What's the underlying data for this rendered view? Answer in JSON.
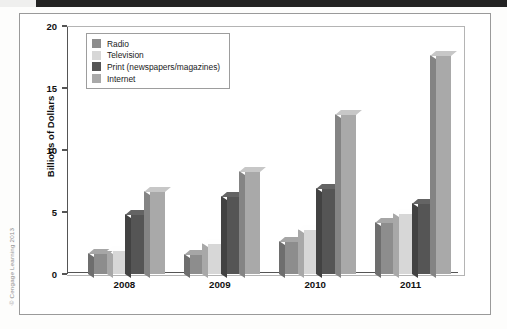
{
  "credit": "© Cengage Learning 2013",
  "chart_data": {
    "type": "bar",
    "title": "",
    "xlabel": "",
    "ylabel": "Billions of Dollars",
    "ylim": [
      0,
      20
    ],
    "yticks": [
      0,
      5,
      10,
      15,
      20
    ],
    "ytick_labels": [
      "0",
      "5",
      "10",
      "15",
      "20"
    ],
    "grid": false,
    "legend_position": "top-left",
    "categories": [
      "2008",
      "2009",
      "2010",
      "2011"
    ],
    "series": [
      {
        "name": "Radio",
        "color": "#8d8d8d",
        "values": [
          1.7,
          1.6,
          2.7,
          4.2
        ]
      },
      {
        "name": "Television",
        "color": "#d7d7d7",
        "values": [
          1.9,
          2.5,
          3.6,
          4.9
        ]
      },
      {
        "name": "Print (newspapers/magazines)",
        "color": "#555555",
        "values": [
          4.8,
          6.3,
          6.9,
          5.7
        ]
      },
      {
        "name": "Internet",
        "color": "#a9a9a9",
        "values": [
          6.7,
          8.3,
          12.9,
          17.7
        ]
      }
    ]
  }
}
